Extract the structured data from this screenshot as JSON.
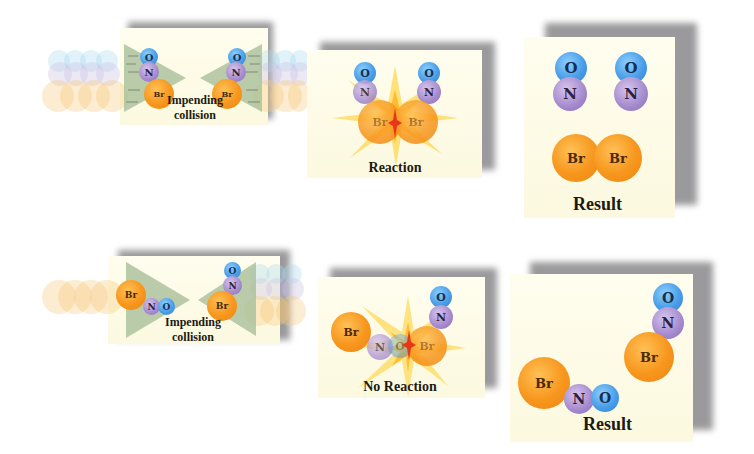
{
  "figure": {
    "rows": [
      {
        "name": "reaction-row",
        "panels": [
          {
            "caption_line1": "Impending",
            "caption_line2": "collision",
            "molecules": [
              "O",
              "N",
              "Br",
              "O",
              "N",
              "Br"
            ]
          },
          {
            "caption": "Reaction",
            "molecules": [
              "O",
              "N",
              "Br",
              "O",
              "N",
              "Br"
            ]
          },
          {
            "caption": "Result",
            "molecules": [
              "O",
              "N",
              "O",
              "N",
              "Br",
              "Br"
            ]
          }
        ]
      },
      {
        "name": "no-reaction-row",
        "panels": [
          {
            "caption_line1": "Impending",
            "caption_line2": "collision",
            "molecules": [
              "Br",
              "N",
              "O",
              "O",
              "N",
              "Br"
            ]
          },
          {
            "caption": "No Reaction",
            "molecules": [
              "Br",
              "N",
              "O",
              "O",
              "N",
              "Br"
            ]
          },
          {
            "caption": "Result",
            "molecules": [
              "O",
              "N",
              "Br",
              "Br",
              "N",
              "O"
            ]
          }
        ]
      }
    ],
    "atom_labels": {
      "oxygen": "O",
      "nitrogen": "N",
      "bromine": "Br"
    },
    "colors": {
      "oxygen": "#4a9ee8",
      "nitrogen": "#a489cc",
      "bromine": "#f7961d",
      "panel_bg": "#fdfbe6",
      "shadow": "#9a9a9c",
      "arrow": "#a8bf9a",
      "burst": "#ffd23a",
      "burst_core": "#e8361a"
    }
  }
}
